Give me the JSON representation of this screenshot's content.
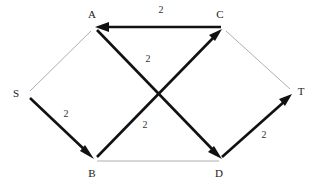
{
  "figure": {
    "background_color": "#ffffff",
    "width": 322,
    "height": 185
  },
  "colors": {
    "thick_edge": "#111111",
    "thin_edge": "#9a9a9a",
    "node_label": "#1a1a1a",
    "weight_label": "#333333"
  },
  "nodes": [
    {
      "id": "S",
      "label": "S",
      "x": 27,
      "y": 95,
      "label_x": 16,
      "label_y": 97
    },
    {
      "id": "A",
      "label": "A",
      "x": 95,
      "y": 27,
      "label_x": 92,
      "label_y": 18
    },
    {
      "id": "B",
      "label": "B",
      "x": 95,
      "y": 160,
      "label_x": 92,
      "label_y": 177
    },
    {
      "id": "C",
      "label": "C",
      "x": 222,
      "y": 27,
      "label_x": 220,
      "label_y": 18
    },
    {
      "id": "D",
      "label": "D",
      "x": 222,
      "y": 160,
      "label_x": 219,
      "label_y": 177
    },
    {
      "id": "T",
      "label": "T",
      "x": 293,
      "y": 93,
      "label_x": 301,
      "label_y": 95
    }
  ],
  "edges": [
    {
      "id": "S-A",
      "from": "S",
      "to": "A",
      "style": "thin",
      "directed": false,
      "weight": "",
      "weight_x": null,
      "weight_y": null
    },
    {
      "id": "S-B",
      "from": "S",
      "to": "B",
      "style": "thick",
      "directed": true,
      "weight": "2",
      "weight_x": 66,
      "weight_y": 117
    },
    {
      "id": "B-C",
      "from": "B",
      "to": "C",
      "style": "thick",
      "directed": true,
      "weight": "2",
      "weight_x": 145,
      "weight_y": 128
    },
    {
      "id": "C-A",
      "from": "C",
      "to": "A",
      "style": "thick",
      "directed": true,
      "weight": "2",
      "weight_x": 161,
      "weight_y": 13
    },
    {
      "id": "A-D",
      "from": "A",
      "to": "D",
      "style": "thick",
      "directed": true,
      "weight": "2",
      "weight_x": 148,
      "weight_y": 62
    },
    {
      "id": "D-T",
      "from": "D",
      "to": "T",
      "style": "thick",
      "directed": true,
      "weight": "2",
      "weight_x": 264,
      "weight_y": 138
    },
    {
      "id": "C-T",
      "from": "C",
      "to": "T",
      "style": "thin",
      "directed": false,
      "weight": "",
      "weight_x": null,
      "weight_y": null
    },
    {
      "id": "B-D",
      "from": "B",
      "to": "D",
      "style": "thin",
      "directed": false,
      "weight": "",
      "weight_x": null,
      "weight_y": null
    }
  ]
}
